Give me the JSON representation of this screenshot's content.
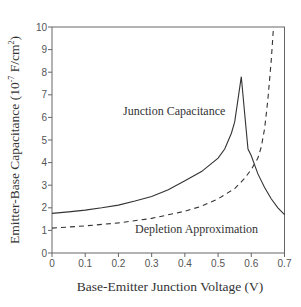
{
  "chart_data": {
    "type": "line",
    "title": "",
    "xlabel": "Base-Emitter Junction Voltage (V)",
    "ylabel_main": "Emitter-Base Capacitance (10",
    "ylabel_sup1": "-7",
    "ylabel_mid": " F/cm",
    "ylabel_sup2": "2",
    "ylabel_end": ")",
    "ylabel": "Emitter-Base Capacitance (10^-7 F/cm^2)",
    "xlim": [
      0,
      0.7
    ],
    "ylim": [
      0,
      10
    ],
    "xticks": [
      "0",
      "0.1",
      "0.2",
      "0.3",
      "0.4",
      "0.5",
      "0.6",
      "0.7"
    ],
    "yticks": [
      "0",
      "1",
      "2",
      "3",
      "4",
      "5",
      "6",
      "7",
      "8",
      "9",
      "10"
    ],
    "grid": false,
    "legend": "none (curves labeled inline)",
    "annotations": [
      {
        "text": "Junction Capacitance",
        "x": 0.36,
        "y": 6.4
      },
      {
        "text": "Depletion Approximation",
        "x": 0.44,
        "y": 1.05
      }
    ],
    "series": [
      {
        "name": "Junction Capacitance",
        "style": "solid",
        "color": "#333333",
        "x": [
          0.0,
          0.05,
          0.1,
          0.15,
          0.2,
          0.25,
          0.3,
          0.35,
          0.4,
          0.45,
          0.5,
          0.52,
          0.54,
          0.55,
          0.56,
          0.57,
          0.58,
          0.59,
          0.6,
          0.61,
          0.62,
          0.64,
          0.66,
          0.68,
          0.7
        ],
        "y": [
          1.75,
          1.82,
          1.9,
          2.0,
          2.12,
          2.3,
          2.5,
          2.8,
          3.2,
          3.6,
          4.2,
          4.6,
          5.3,
          5.8,
          6.8,
          7.8,
          6.2,
          4.6,
          4.3,
          3.9,
          3.5,
          2.9,
          2.4,
          2.0,
          1.7
        ]
      },
      {
        "name": "Depletion Approximation",
        "style": "dashed",
        "color": "#333333",
        "x": [
          0.0,
          0.1,
          0.2,
          0.3,
          0.4,
          0.45,
          0.5,
          0.55,
          0.58,
          0.6,
          0.62,
          0.63,
          0.64,
          0.65,
          0.66,
          0.667
        ],
        "y": [
          1.1,
          1.2,
          1.33,
          1.53,
          1.85,
          2.07,
          2.4,
          2.85,
          3.3,
          3.7,
          4.2,
          4.7,
          5.5,
          6.8,
          8.5,
          10.0
        ]
      }
    ]
  }
}
